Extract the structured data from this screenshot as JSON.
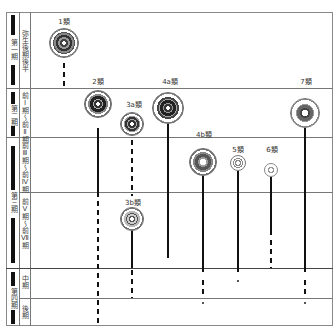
{
  "periods": [
    {
      "label": "第一期",
      "sub": [
        "弥生後期後半"
      ]
    },
    {
      "label": "第二期",
      "sub": [
        "前I期〜前II期"
      ]
    },
    {
      "label": "第三期",
      "sub": [
        "前III期〜前IV期",
        "前V期〜前VII期"
      ]
    },
    {
      "label": "第四期",
      "sub": [
        "中期",
        "後期"
      ]
    }
  ],
  "sub_periods": [
    {
      "label": "弥生後期後半"
    },
    {
      "label": "前Ⅰ期〜前Ⅱ期"
    },
    {
      "label": "前Ⅲ期〜前Ⅳ期"
    },
    {
      "label": "前Ⅴ期〜前Ⅶ期"
    },
    {
      "label": "中期"
    },
    {
      "label": "後期"
    }
  ],
  "types": [
    {
      "label": "1類",
      "x": 64,
      "label_y": 17,
      "cy": 43,
      "d": 30
    },
    {
      "label": "2類",
      "x": 98,
      "label_y": 77,
      "cy": 105,
      "d": 28
    },
    {
      "label": "3a類",
      "x": 132,
      "label_y": 100,
      "cy": 124,
      "d": 24
    },
    {
      "label": "4a類",
      "x": 168,
      "label_y": 77,
      "cy": 108,
      "d": 32
    },
    {
      "label": "4b類",
      "x": 203,
      "label_y": 130,
      "cy": 162,
      "d": 28
    },
    {
      "label": "5類",
      "x": 238,
      "label_y": 145,
      "cy": 163,
      "d": 16
    },
    {
      "label": "6類",
      "x": 272,
      "label_y": 145,
      "cy": 170,
      "d": 14
    },
    {
      "label": "7類",
      "x": 305,
      "label_y": 77,
      "cy": 113,
      "d": 30
    },
    {
      "label": "3b類",
      "x": 132,
      "label_y": 197,
      "cy": 219,
      "d": 24
    }
  ]
}
